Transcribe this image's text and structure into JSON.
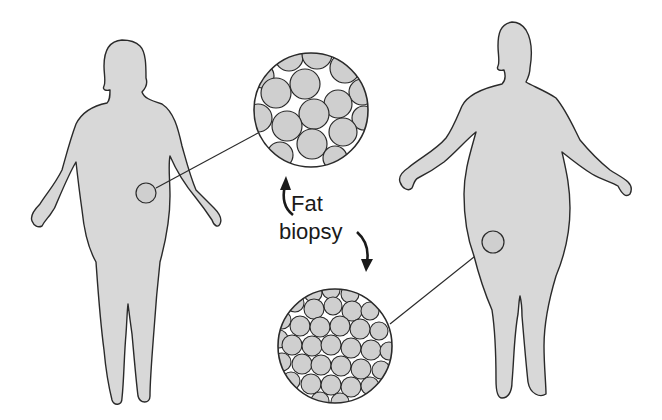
{
  "diagram": {
    "labels": {
      "line1": "Fat",
      "line2": "biopsy"
    },
    "colors": {
      "body_fill": "#d8d8d8",
      "outline": "#2a2a2a",
      "cell_fill": "#cfcfcf",
      "background": "#ffffff"
    },
    "figures": [
      {
        "name": "lean-obese-figure-left",
        "biopsy_site": "abdomen",
        "cell_size": "large"
      },
      {
        "name": "obese-figure-right",
        "biopsy_site": "thigh",
        "cell_size": "small"
      }
    ]
  }
}
